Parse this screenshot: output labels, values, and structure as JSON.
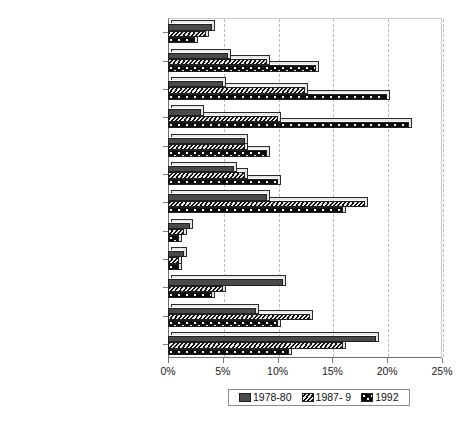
{
  "chart_data": {
    "type": "bar",
    "orientation": "horizontal",
    "title": "",
    "subtitle": "",
    "xlabel": "",
    "ylabel": "",
    "xlim": [
      0,
      25
    ],
    "xunit": "%",
    "grid": true,
    "legend_position": "bottom",
    "xticks": [
      "0%",
      "5%",
      "10%",
      "15%",
      "20%",
      "25%"
    ],
    "xtickvalues": [
      0,
      5,
      10,
      15,
      20,
      25
    ],
    "categories": [
      "Commercial communications",
      "Tele/data communications",
      "Computer hardware",
      "Computer software",
      "Other electronics",
      "Biotechnology",
      "Medical/healthcare",
      "Energy/natural resources",
      "Industrial automation",
      "Industrial products",
      "Consumer products",
      "Other"
    ],
    "series": [
      {
        "name": "1978-80",
        "pattern": "solid-dark-gray",
        "color": "#4a4a4a",
        "values": [
          4.0,
          5.5,
          5.0,
          3.0,
          7.0,
          6.0,
          9.0,
          2.0,
          1.5,
          10.5,
          8.0,
          19.0
        ]
      },
      {
        "name": "1987- 9",
        "pattern": "diagonal-hatch",
        "color": "#111111",
        "values": [
          3.5,
          9.0,
          12.5,
          10.0,
          7.0,
          7.0,
          18.0,
          1.5,
          1.0,
          5.0,
          13.0,
          16.0
        ]
      },
      {
        "name": "1992",
        "pattern": "dotted",
        "color": "#0a0a0a",
        "values": [
          2.5,
          13.5,
          20.0,
          22.0,
          9.0,
          10.0,
          16.0,
          1.0,
          1.0,
          4.0,
          10.0,
          11.0
        ]
      }
    ]
  },
  "legend": {
    "entries": [
      "1978-80",
      "1987- 9",
      "1992"
    ]
  }
}
